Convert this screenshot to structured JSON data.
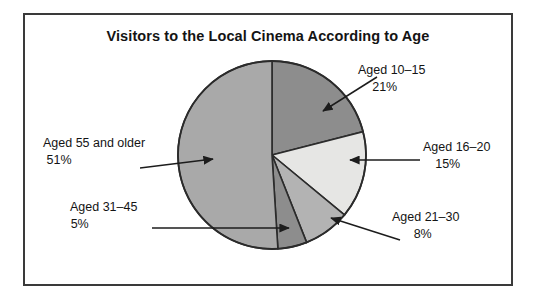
{
  "figure": {
    "title": "Visitors to the Local Cinema According to Age",
    "border_color": "#3a3a3a",
    "background": "#ffffff"
  },
  "chart_data": {
    "type": "pie",
    "title": "Visitors to the Local Cinema According to Age",
    "xlabel": "",
    "ylabel": "",
    "units": "percent",
    "total": 100,
    "start_angle_deg": 0,
    "direction": "clockwise",
    "legend": "none (direct labels with leader arrows)",
    "grid": false,
    "categories": [
      "Aged 10–15",
      "Aged 16–20",
      "Aged 21–30",
      "Aged 31–45",
      "Aged 55 and older"
    ],
    "values": [
      21,
      15,
      8,
      5,
      51
    ],
    "labels": [
      "21%",
      "15%",
      "8%",
      "5%",
      "51%"
    ],
    "colors": [
      "#8d8d8d",
      "#e6e6e4",
      "#b3b3b3",
      "#8d8d8d",
      "#a9a9a9"
    ],
    "slices": [
      {
        "category": "Aged 10–15",
        "value": 21,
        "label": "21%",
        "color": "#8d8d8d",
        "start_deg": 0,
        "end_deg": 75.6
      },
      {
        "category": "Aged 16–20",
        "value": 15,
        "label": "15%",
        "color": "#e6e6e4",
        "start_deg": 75.6,
        "end_deg": 129.6
      },
      {
        "category": "Aged 21–30",
        "value": 8,
        "label": "8%",
        "color": "#b3b3b3",
        "start_deg": 129.6,
        "end_deg": 158.4
      },
      {
        "category": "Aged 31–45",
        "value": 5,
        "label": "5%",
        "color": "#8d8d8d",
        "start_deg": 158.4,
        "end_deg": 176.4
      },
      {
        "category": "Aged 55 and older",
        "value": 51,
        "label": "51%",
        "color": "#a9a9a9",
        "start_deg": 176.4,
        "end_deg": 360
      }
    ]
  },
  "callouts": {
    "aged_10_15": {
      "category": "Aged 10–15",
      "percent": "21%"
    },
    "aged_16_20": {
      "category": "Aged 16–20",
      "percent": "15%"
    },
    "aged_21_30": {
      "category": "Aged 21–30",
      "percent": "8%"
    },
    "aged_31_45": {
      "category": "Aged 31–45",
      "percent": "5%"
    },
    "aged_55_older": {
      "category": "Aged 55 and older",
      "percent": "51%"
    }
  }
}
